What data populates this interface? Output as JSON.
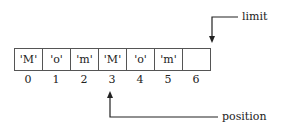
{
  "diagram": {
    "type": "buffer-diagram",
    "cells": [
      "'M'",
      "'o'",
      "'m'",
      "'M'",
      "'o'",
      "'m'",
      ""
    ],
    "indices": [
      "0",
      "1",
      "2",
      "3",
      "4",
      "5",
      "6"
    ],
    "pointers": {
      "limit": {
        "label": "limit",
        "index": 6
      },
      "position": {
        "label": "position",
        "index": 3
      }
    }
  }
}
